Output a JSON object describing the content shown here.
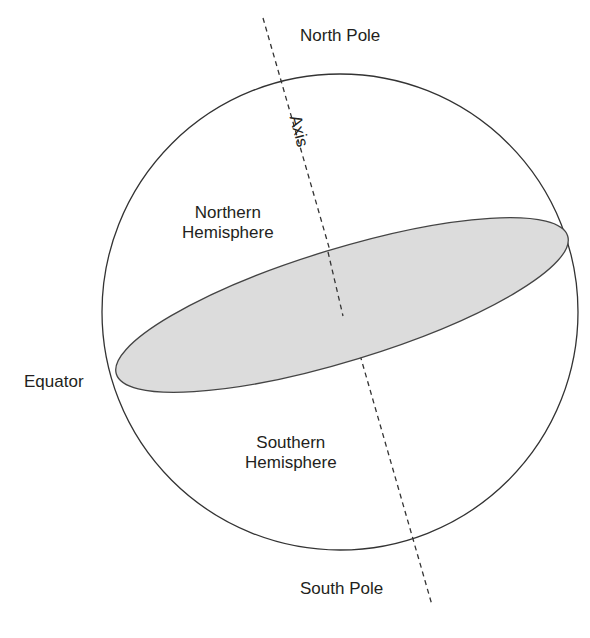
{
  "diagram": {
    "labels": {
      "north_pole": "North Pole",
      "south_pole": "South Pole",
      "axis": "Axis",
      "equator": "Equator",
      "northern_line1": "Northern",
      "northern_line2": "Hemisphere",
      "southern_line1": "Southern",
      "southern_line2": "Hemisphere"
    },
    "colors": {
      "stroke": "#333333",
      "equator_fill": "#dcdcdc",
      "text": "#231f20"
    }
  }
}
